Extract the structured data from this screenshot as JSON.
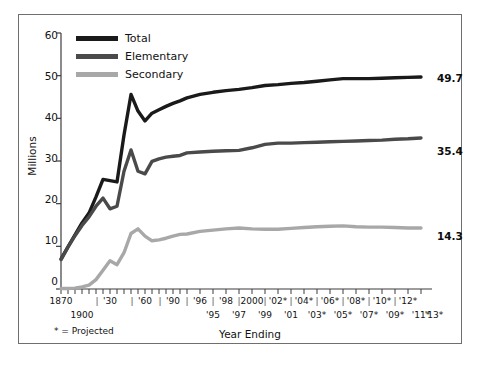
{
  "chart_data": {
    "type": "line",
    "title": "",
    "xlabel": "Year Ending",
    "ylabel": "Millions",
    "ylim": [
      0,
      60
    ],
    "yticks": [
      0,
      10,
      20,
      30,
      40,
      50,
      60
    ],
    "grid": false,
    "legend_position": "top-left",
    "footnote": "* = Projected",
    "x_tick_labels_upper": [
      "1870",
      "'30",
      "'60",
      "'90",
      "'96",
      "'98",
      "2000",
      "'02*",
      "'04*",
      "'06*",
      "'08*",
      "'10*",
      "'12*"
    ],
    "x_tick_labels_lower": [
      "1900",
      "'95",
      "'97",
      "'99",
      "'01",
      "'03*",
      "'05*",
      "'07*",
      "'09*",
      "'11*",
      "'13*"
    ],
    "x": [
      "1870",
      "1880",
      "1890",
      "1900",
      "1910",
      "1920",
      "1930",
      "1940",
      "1950",
      "1960",
      "1970",
      "1980",
      "1985",
      "1990",
      "1991",
      "1992",
      "1993",
      "1994",
      "1995",
      "1996",
      "1997",
      "1998",
      "1999",
      "2000",
      "2001",
      "2002",
      "2003",
      "2004",
      "2005",
      "2006",
      "2007",
      "2008",
      "2009",
      "2010",
      "2011",
      "2012",
      "2013"
    ],
    "series": [
      {
        "name": "Total",
        "color": "#1a1a1a",
        "end_label": "49.7",
        "values": [
          7.0,
          9.9,
          12.7,
          15.5,
          17.8,
          21.6,
          25.7,
          25.4,
          25.1,
          36.1,
          45.6,
          41.7,
          39.4,
          41.2,
          42.0,
          42.8,
          43.5,
          44.1,
          44.8,
          45.6,
          46.1,
          46.5,
          46.8,
          47.2,
          47.7,
          47.9,
          48.2,
          48.4,
          48.7,
          49.0,
          49.3,
          49.3,
          49.3,
          49.4,
          49.5,
          49.6,
          49.7
        ]
      },
      {
        "name": "Elementary",
        "color": "#4a4a4a",
        "end_label": "35.4",
        "values": [
          6.9,
          9.8,
          12.5,
          14.9,
          16.9,
          19.4,
          21.3,
          18.8,
          19.4,
          27.6,
          32.6,
          27.6,
          27.0,
          29.9,
          30.5,
          30.9,
          31.1,
          31.3,
          31.9,
          32.1,
          32.3,
          32.4,
          32.5,
          33.1,
          33.9,
          34.2,
          34.2,
          34.3,
          34.4,
          34.5,
          34.6,
          34.7,
          34.8,
          34.9,
          35.1,
          35.2,
          35.4
        ]
      },
      {
        "name": "Secondary",
        "color": "#a8a8a8",
        "end_label": "14.3",
        "values": [
          0.1,
          0.11,
          0.2,
          0.5,
          0.9,
          2.2,
          4.4,
          6.6,
          5.7,
          8.5,
          13.0,
          14.1,
          12.4,
          11.3,
          11.5,
          11.9,
          12.4,
          12.8,
          12.9,
          13.5,
          13.8,
          14.1,
          14.3,
          14.1,
          14.0,
          14.0,
          14.2,
          14.4,
          14.6,
          14.7,
          14.8,
          14.6,
          14.5,
          14.5,
          14.4,
          14.3,
          14.3
        ]
      }
    ]
  },
  "legend": {
    "items": [
      {
        "label": "Total",
        "color": "#1a1a1a"
      },
      {
        "label": "Elementary",
        "color": "#4a4a4a"
      },
      {
        "label": "Secondary",
        "color": "#a8a8a8"
      }
    ]
  },
  "axes": {
    "y_label": "Millions",
    "x_label": "Year Ending",
    "y_tick_labels": [
      "60",
      "50",
      "40",
      "30",
      "20",
      "10",
      "0"
    ],
    "footnote": "* = Projected"
  },
  "end_labels": {
    "total": "49.7",
    "elementary": "35.4",
    "secondary": "14.3"
  }
}
